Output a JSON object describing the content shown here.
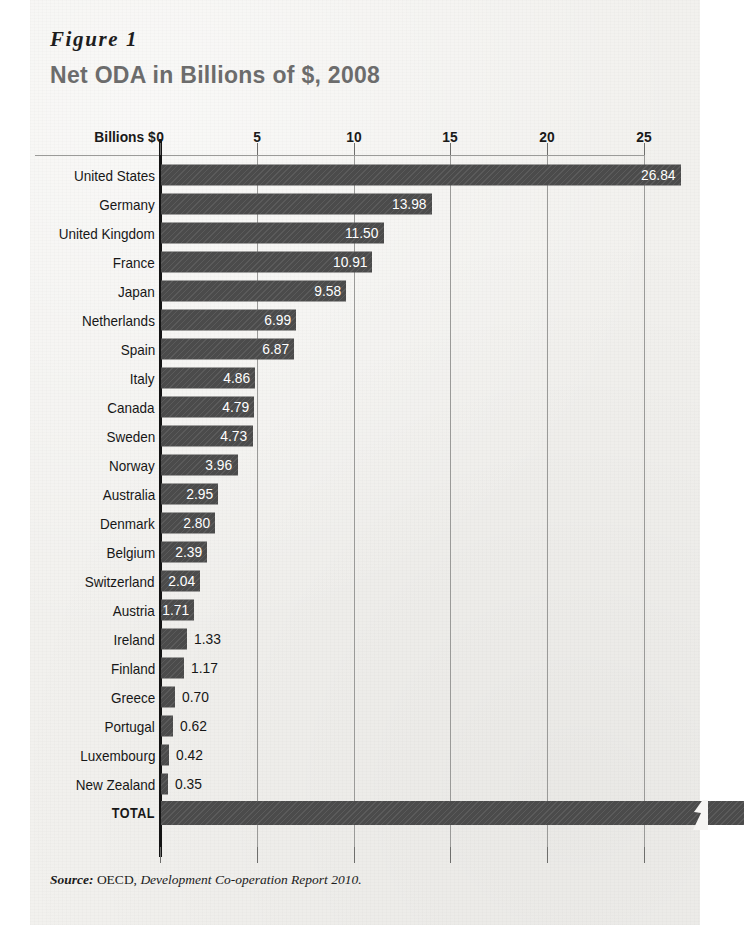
{
  "figure": {
    "label": "Figure 1",
    "title": "Net ODA in Billions of $, 2008",
    "source_word": "Source:",
    "source_agency": "OECD,",
    "source_title": "Development Co-operation Report 2010."
  },
  "axis": {
    "caption": "Billions $",
    "ticks": [
      "0",
      "5",
      "10",
      "15",
      "20",
      "25"
    ]
  },
  "chart_data": {
    "type": "bar",
    "orientation": "horizontal",
    "title": "Net ODA in Billions of $, 2008",
    "xlabel": "Billions $",
    "ylabel": "",
    "xlim": [
      0,
      25
    ],
    "xticks": [
      0,
      5,
      10,
      15,
      20,
      25
    ],
    "grid": true,
    "legend": false,
    "axis_break": true,
    "axis_break_note": "TOTAL bar extends beyond the 25 axis limit and is cut with a zigzag break mark",
    "categories": [
      "United States",
      "Germany",
      "United Kingdom",
      "France",
      "Japan",
      "Netherlands",
      "Spain",
      "Italy",
      "Canada",
      "Sweden",
      "Norway",
      "Australia",
      "Denmark",
      "Belgium",
      "Switzerland",
      "Austria",
      "Ireland",
      "Finland",
      "Greece",
      "Portugal",
      "Luxembourg",
      "New Zealand",
      "TOTAL"
    ],
    "values": [
      26.84,
      13.98,
      11.5,
      10.91,
      9.58,
      6.99,
      6.87,
      4.86,
      4.79,
      4.73,
      3.96,
      2.95,
      2.8,
      2.39,
      2.04,
      1.71,
      1.33,
      1.17,
      0.7,
      0.62,
      0.42,
      0.35,
      null
    ],
    "value_labels": [
      "26.84",
      "13.98",
      "11.50",
      "10.91",
      "9.58",
      "6.99",
      "6.87",
      "4.86",
      "4.79",
      "4.73",
      "3.96",
      "2.95",
      "2.80",
      "2.39",
      "2.04",
      "1.71",
      "1.33",
      "1.17",
      "0.70",
      "0.62",
      "0.42",
      "0.35",
      ""
    ]
  },
  "rows": [
    {
      "label": "United States",
      "value": 26.84,
      "value_label": "26.84",
      "inside": true,
      "total": false
    },
    {
      "label": "Germany",
      "value": 13.98,
      "value_label": "13.98",
      "inside": true,
      "total": false
    },
    {
      "label": "United Kingdom",
      "value": 11.5,
      "value_label": "11.50",
      "inside": true,
      "total": false
    },
    {
      "label": "France",
      "value": 10.91,
      "value_label": "10.91",
      "inside": true,
      "total": false
    },
    {
      "label": "Japan",
      "value": 9.58,
      "value_label": "9.58",
      "inside": true,
      "total": false
    },
    {
      "label": "Netherlands",
      "value": 6.99,
      "value_label": "6.99",
      "inside": true,
      "total": false
    },
    {
      "label": "Spain",
      "value": 6.87,
      "value_label": "6.87",
      "inside": true,
      "total": false
    },
    {
      "label": "Italy",
      "value": 4.86,
      "value_label": "4.86",
      "inside": true,
      "total": false
    },
    {
      "label": "Canada",
      "value": 4.79,
      "value_label": "4.79",
      "inside": true,
      "total": false
    },
    {
      "label": "Sweden",
      "value": 4.73,
      "value_label": "4.73",
      "inside": true,
      "total": false
    },
    {
      "label": "Norway",
      "value": 3.96,
      "value_label": "3.96",
      "inside": true,
      "total": false
    },
    {
      "label": "Australia",
      "value": 2.95,
      "value_label": "2.95",
      "inside": true,
      "total": false
    },
    {
      "label": "Denmark",
      "value": 2.8,
      "value_label": "2.80",
      "inside": true,
      "total": false
    },
    {
      "label": "Belgium",
      "value": 2.39,
      "value_label": "2.39",
      "inside": true,
      "total": false
    },
    {
      "label": "Switzerland",
      "value": 2.04,
      "value_label": "2.04",
      "inside": true,
      "total": false
    },
    {
      "label": "Austria",
      "value": 1.71,
      "value_label": "1.71",
      "inside": true,
      "total": false
    },
    {
      "label": "Ireland",
      "value": 1.33,
      "value_label": "1.33",
      "inside": false,
      "total": false
    },
    {
      "label": "Finland",
      "value": 1.17,
      "value_label": "1.17",
      "inside": false,
      "total": false
    },
    {
      "label": "Greece",
      "value": 0.7,
      "value_label": "0.70",
      "inside": false,
      "total": false
    },
    {
      "label": "Portugal",
      "value": 0.62,
      "value_label": "0.62",
      "inside": false,
      "total": false
    },
    {
      "label": "Luxembourg",
      "value": 0.42,
      "value_label": "0.42",
      "inside": false,
      "total": false
    },
    {
      "label": "New Zealand",
      "value": 0.35,
      "value_label": "0.35",
      "inside": false,
      "total": false
    },
    {
      "label": "TOTAL",
      "value": 30.2,
      "value_label": "",
      "inside": true,
      "total": true
    }
  ],
  "colors": {
    "bar": "#4b4b4b",
    "paper": "#f2f1ee",
    "title": "#6c6c6c",
    "grid": "#9a9a98",
    "axis": "#141414"
  }
}
